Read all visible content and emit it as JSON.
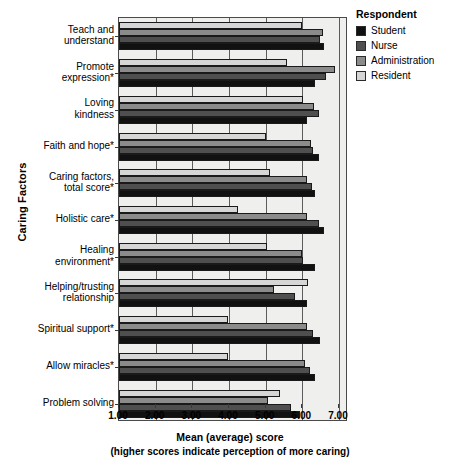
{
  "chart_data": {
    "type": "bar",
    "orientation": "horizontal",
    "title": "",
    "xlabel": "Mean (average) score",
    "xsublabel": "(higher scores indicate perception of more caring)",
    "ylabel": "Caring Factors",
    "xlim": [
      1.0,
      7.0
    ],
    "xticks": [
      "1.00",
      "2.00",
      "3.00",
      "4.00",
      "5.00",
      "6.00",
      "7.00"
    ],
    "xtick_values": [
      1.0,
      2.0,
      3.0,
      4.0,
      5.0,
      6.0,
      7.0
    ],
    "grid": true,
    "legend_position": "right",
    "legend_title": "Respondent",
    "categories": [
      "Teach and understand",
      "Promote expression*",
      "Loving kindness",
      "Faith and hope*",
      "Caring factors, total score*",
      "Holistic care*",
      "Healing environment*",
      "Helping/trusting relationship",
      "Spiritual support*",
      "Allow miracles*",
      "Problem solving"
    ],
    "category_lines": [
      [
        "Teach and",
        "understand"
      ],
      [
        "Promote",
        "expression*"
      ],
      [
        "Loving",
        "kindness"
      ],
      [
        "Faith and hope*"
      ],
      [
        "Caring factors,",
        "total score*"
      ],
      [
        "Holistic care*"
      ],
      [
        "Healing",
        "environment*"
      ],
      [
        "Helping/trusting",
        "relationship"
      ],
      [
        "Spiritual support*"
      ],
      [
        "Allow miracles*"
      ],
      [
        "Problem solving"
      ]
    ],
    "series": [
      {
        "name": "Student",
        "color": "#111111",
        "values": [
          6.58,
          6.34,
          6.14,
          6.46,
          6.35,
          6.59,
          6.35,
          6.12,
          6.48,
          6.35,
          5.94
        ]
      },
      {
        "name": "Nurse",
        "color": "#4f4f4f",
        "values": [
          6.48,
          6.64,
          6.46,
          6.3,
          6.25,
          6.46,
          6.01,
          5.8,
          6.3,
          6.21,
          5.69
        ]
      },
      {
        "name": "Administration",
        "color": "#8b8b8b",
        "values": [
          6.56,
          6.89,
          6.32,
          6.23,
          6.12,
          6.14,
          5.98,
          5.22,
          6.12,
          6.08,
          5.05
        ]
      },
      {
        "name": "Resident",
        "color": "#d6d6d6",
        "values": [
          6.0,
          5.57,
          6.03,
          5.0,
          5.13,
          4.25,
          5.03,
          6.16,
          3.96,
          3.98,
          5.4
        ]
      }
    ]
  }
}
